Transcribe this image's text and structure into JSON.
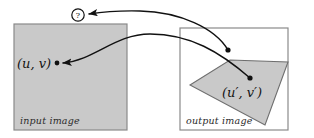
{
  "figure": {
    "kind": "image-warping-diagram",
    "background_color": "#ffffff",
    "stroke_color": "#111111",
    "fill_gray": "#c9c9c9",
    "outline_gray": "#8a8a8a"
  },
  "input_panel": {
    "caption": "input image",
    "point_label": "(u, v)",
    "rect": {
      "x": 14,
      "y": 24,
      "width": 113,
      "height": 106
    },
    "point": {
      "x": 57,
      "y": 63
    },
    "fill": "#c9c9c9"
  },
  "output_panel": {
    "caption": "output image",
    "point_label": "(u′, v′)",
    "rect": {
      "x": 180,
      "y": 28,
      "width": 108,
      "height": 102
    },
    "point": {
      "x": 250,
      "y": 78
    },
    "quad_points": "230,60 288,62 265,125 190,85",
    "fill": "#c9c9c9"
  },
  "query_marker": {
    "label": "?",
    "center": {
      "x": 78,
      "y": 15
    },
    "radius": 6.5
  },
  "arrows": [
    {
      "name": "inverse-map-arrow",
      "from_point": {
        "x": 250,
        "y": 78
      },
      "to_point": {
        "x": 62,
        "y": 63
      },
      "has_arrowhead": true,
      "description": "curve from output point back to input point"
    },
    {
      "name": "query-arrow",
      "from_point": {
        "x": 228,
        "y": 50
      },
      "to_point": {
        "x": 87,
        "y": 14
      },
      "has_arrowhead": true,
      "description": "curve from output sample location to question marker"
    }
  ]
}
